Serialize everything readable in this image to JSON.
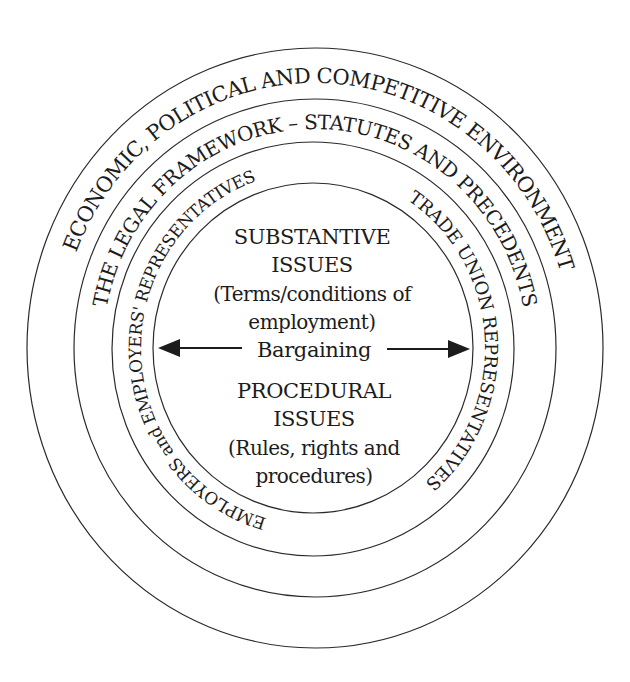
{
  "diagram": {
    "type": "concentric-ellipses",
    "rings": [
      {
        "id": "outer",
        "label": "ECONOMIC, POLITICAL AND COMPETITIVE ENVIRONMENT"
      },
      {
        "id": "legal",
        "label": "THE LEGAL FRAMEWORK – STATUTES AND PRECEDENTS"
      },
      {
        "id": "employers",
        "label": "EMPLOYERS and EMPLOYERS' REPRESENTATIVES"
      },
      {
        "id": "trade-union",
        "label": "TRADE UNION REPRESENTATIVES"
      }
    ],
    "center": {
      "substantive": {
        "title_line1": "SUBSTANTIVE",
        "title_line2": "ISSUES",
        "desc_line1": "(Terms/conditions of",
        "desc_line2": "employment)"
      },
      "bargaining": "Bargaining",
      "procedural": {
        "title_line1": "PROCEDURAL",
        "title_line2": "ISSUES",
        "desc_line1": "(Rules, rights and",
        "desc_line2": "procedures)"
      }
    },
    "colors": {
      "line": "#2a2a2a",
      "text": "#1c1c1c",
      "background": "#ffffff"
    }
  }
}
